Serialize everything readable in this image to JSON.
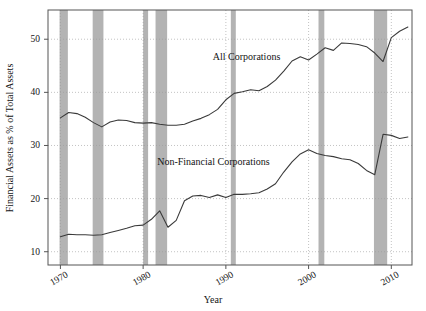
{
  "chart_data": {
    "type": "line",
    "title": "",
    "xlabel": "Year",
    "ylabel": "Financial Assets as % of Total Assets",
    "xlim": [
      1968.5,
      2012.5
    ],
    "ylim": [
      7.5,
      55.5
    ],
    "xticks": [
      1970,
      1980,
      1990,
      2000,
      2010
    ],
    "xtick_labels": [
      "1970",
      "1980",
      "1990",
      "2000",
      "2010"
    ],
    "yticks": [
      10,
      20,
      30,
      40,
      50
    ],
    "ytick_labels": [
      "10",
      "20",
      "30",
      "40",
      "50"
    ],
    "grid": true,
    "grid_style": "dotted",
    "legend_position": "inline-annotations",
    "line_color": "#3a3a3a",
    "band_color": "#b3b3b3",
    "axes_color": "#555555",
    "background_color": "#ffffff",
    "annotations": [
      {
        "text": "All Corporations",
        "x": 1992.5,
        "y": 46.0
      },
      {
        "text": "Non-Financial Corporations",
        "x": 1988.5,
        "y": 26.4
      }
    ],
    "recession_bands": [
      {
        "label": "1969-1970",
        "start": 1969.9,
        "end": 1970.9
      },
      {
        "label": "1973-1975",
        "start": 1973.9,
        "end": 1975.2
      },
      {
        "label": "1980",
        "start": 1980.0,
        "end": 1980.6
      },
      {
        "label": "1981-1982",
        "start": 1981.5,
        "end": 1982.9
      },
      {
        "label": "1990-1991",
        "start": 1990.6,
        "end": 1991.2
      },
      {
        "label": "2001",
        "start": 2001.2,
        "end": 2001.9
      },
      {
        "label": "2007-2009",
        "start": 2007.9,
        "end": 2009.5
      }
    ],
    "x": [
      1970,
      1971,
      1972,
      1973,
      1974,
      1975,
      1976,
      1977,
      1978,
      1979,
      1980,
      1981,
      1982,
      1983,
      1984,
      1985,
      1986,
      1987,
      1988,
      1989,
      1990,
      1991,
      1992,
      1993,
      1994,
      1995,
      1996,
      1997,
      1998,
      1999,
      2000,
      2001,
      2002,
      2003,
      2004,
      2005,
      2006,
      2007,
      2008,
      2009,
      2010,
      2011,
      2012
    ],
    "series": [
      {
        "name": "All Corporations",
        "values": [
          35.2,
          36.2,
          36.0,
          35.3,
          34.3,
          33.5,
          34.4,
          34.8,
          34.7,
          34.3,
          34.2,
          34.3,
          34.0,
          33.8,
          33.8,
          34.0,
          34.6,
          35.1,
          35.8,
          36.8,
          38.6,
          39.8,
          40.1,
          40.5,
          40.3,
          41.1,
          42.3,
          44.0,
          45.9,
          46.7,
          46.1,
          47.2,
          48.4,
          47.9,
          49.3,
          49.2,
          49.0,
          48.6,
          47.4,
          45.8,
          50.3,
          51.5,
          52.3
        ]
      },
      {
        "name": "Non-Financial Corporations",
        "values": [
          12.8,
          13.3,
          13.2,
          13.2,
          13.1,
          13.2,
          13.6,
          14.0,
          14.4,
          14.9,
          15.0,
          16.1,
          17.7,
          14.6,
          15.9,
          19.6,
          20.5,
          20.6,
          20.2,
          20.7,
          20.2,
          20.8,
          20.8,
          20.9,
          21.1,
          21.8,
          22.8,
          25.0,
          26.9,
          28.4,
          29.2,
          28.5,
          28.1,
          27.9,
          27.5,
          27.3,
          26.6,
          25.3,
          24.5,
          32.1,
          31.9,
          31.3,
          31.6
        ]
      }
    ]
  },
  "figure": {
    "x_axis_title": "Year",
    "y_axis_title": "Financial Assets as % of Total Assets"
  }
}
